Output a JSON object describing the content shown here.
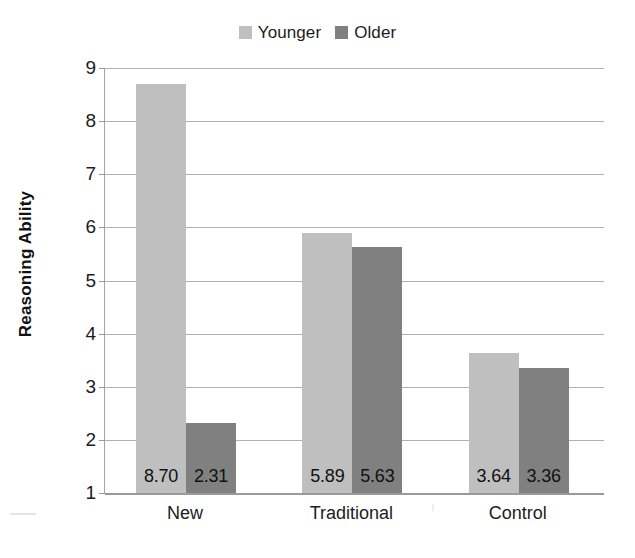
{
  "chart_data": {
    "type": "bar",
    "title": "",
    "subtitle": "",
    "xlabel": "",
    "ylabel": "Reasoning Ability",
    "categories": [
      "New",
      "Traditional",
      "Control"
    ],
    "series": [
      {
        "name": "Younger",
        "color": "#bfbfbf",
        "values": [
          8.7,
          5.89,
          3.64
        ],
        "labels": [
          "8.70",
          "5.89",
          "3.64"
        ]
      },
      {
        "name": "Older",
        "color": "#808080",
        "values": [
          2.31,
          5.63,
          3.36
        ],
        "labels": [
          "2.31",
          "5.63",
          "3.36"
        ]
      }
    ],
    "ylim": [
      1,
      9
    ],
    "yticks": [
      1,
      2,
      3,
      4,
      5,
      6,
      7,
      8,
      9
    ],
    "ytick_labels": [
      "1",
      "2",
      "3",
      "4",
      "5",
      "6",
      "7",
      "8",
      "9"
    ],
    "grid": true,
    "grid_axis": "y",
    "legend_position": "top-center",
    "data_labels": true,
    "data_label_position": "inside-base"
  },
  "legend": {
    "entries": [
      {
        "label": "Younger",
        "color": "#bfbfbf"
      },
      {
        "label": "Older",
        "color": "#808080"
      }
    ]
  },
  "axis": {
    "y_title": "Reasoning Ability"
  }
}
